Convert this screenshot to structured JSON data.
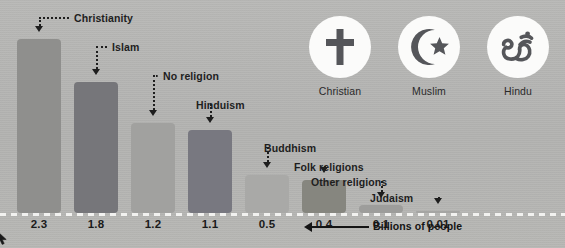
{
  "chart_data": {
    "type": "bar",
    "title": "",
    "xlabel": "",
    "ylabel": "Billions of people",
    "axis_note": "Billions of people",
    "ylim": [
      0,
      2.6
    ],
    "grid": false,
    "legend_position": "top-right",
    "categories": [
      "Christianity",
      "Islam",
      "No religion",
      "Hinduism",
      "Buddhism",
      "Folk religions",
      "Other religions",
      "Judaism"
    ],
    "values": [
      2.3,
      1.8,
      1.2,
      1.1,
      0.5,
      0.4,
      0.1,
      0.01
    ],
    "value_labels": [
      "2.3",
      "1.8",
      "1.2",
      "1.1",
      "0.5",
      "0.4",
      "0.1",
      "0.01"
    ],
    "bar_colors": [
      "#8f8f8d",
      "#76767a",
      "#a1a19f",
      "#787880",
      "#a9a9a7",
      "#86867f",
      "#9d9d9b",
      "#a5a5a3"
    ]
  },
  "bars": [
    {
      "label": "Christianity",
      "value_label": "2.3",
      "x": 17,
      "width": 44,
      "top": 39,
      "color": "#8f8f8d"
    },
    {
      "label": "Islam",
      "value_label": "1.8",
      "x": 74,
      "width": 44,
      "top": 82,
      "color": "#76767a"
    },
    {
      "label": "No religion",
      "value_label": "1.2",
      "x": 131,
      "width": 44,
      "top": 123,
      "color": "#a1a19f"
    },
    {
      "label": "Hinduism",
      "value_label": "1.1",
      "x": 188,
      "width": 44,
      "top": 130,
      "color": "#787880"
    },
    {
      "label": "Buddhism",
      "value_label": "0.5",
      "x": 245,
      "width": 44,
      "top": 175,
      "color": "#a9a9a7"
    },
    {
      "label": "Folk religions",
      "value_label": "0.4",
      "x": 302,
      "width": 44,
      "top": 180,
      "color": "#86867f"
    },
    {
      "label": "Other religions",
      "value_label": "0.1",
      "x": 359,
      "width": 44,
      "top": 205,
      "color": "#9d9d9b"
    },
    {
      "label": "Judaism",
      "value_label": "0.01",
      "x": 416,
      "width": 44,
      "top": 211,
      "color": "#a5a5a3"
    }
  ],
  "callouts": [
    {
      "text": "Christianity",
      "text_x": 74,
      "text_y": 12
    },
    {
      "text": "Islam",
      "text_x": 112,
      "text_y": 41
    },
    {
      "text": "No religion",
      "text_x": 163,
      "text_y": 70
    },
    {
      "text": "Hinduism",
      "text_x": 196,
      "text_y": 99
    },
    {
      "text": "Buddhism",
      "text_x": 264,
      "text_y": 142
    },
    {
      "text": "Folk religions",
      "text_x": 294,
      "text_y": 161
    },
    {
      "text": "Other religions",
      "text_x": 311,
      "text_y": 176
    },
    {
      "text": "Judaism",
      "text_x": 370,
      "text_y": 192
    }
  ],
  "legend": {
    "items": [
      {
        "label": "Christian",
        "icon": "cross-icon",
        "cx": 340,
        "cy": 47
      },
      {
        "label": "Muslim",
        "icon": "crescent-star-icon",
        "cx": 429,
        "cy": 47
      },
      {
        "label": "Hindu",
        "icon": "om-icon",
        "cx": 518,
        "cy": 47
      }
    ]
  },
  "axis_annotation": {
    "text": "Billions of people",
    "arrow": "left-arrow-icon"
  },
  "colors": {
    "background": "#b4b4b2",
    "axis_dash": "#f2f2f0",
    "text": "#1b1b1b",
    "badge_bg": "#fbfbfa",
    "icon": "#55565a"
  }
}
